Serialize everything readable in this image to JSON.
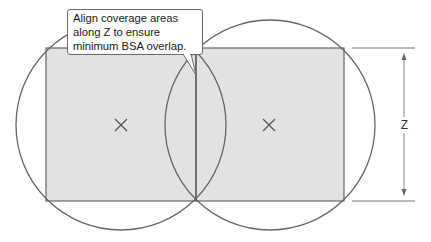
{
  "callout": {
    "text": "Align coverage areas along Z to ensure minimum BSA overlap."
  },
  "dimension": {
    "label": "Z"
  },
  "markers": {
    "left_center": "x-mark-icon",
    "right_center": "x-mark-icon"
  },
  "colors": {
    "fill": "#e2e2e2",
    "stroke": "#666666",
    "dimension_line": "#888888",
    "background": "#ffffff"
  }
}
